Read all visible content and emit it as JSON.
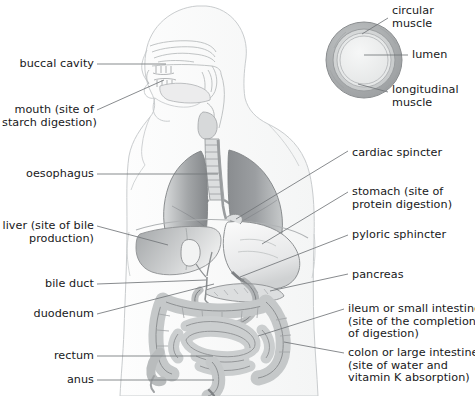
{
  "diagram": {
    "type": "anatomical-diagram",
    "colors": {
      "background": "#ffffff",
      "text": "#17181a",
      "leader_line": "#6e7276",
      "body_outline": "#c9ccce",
      "lung_dark": "#8e9194",
      "lung_light": "#d9dbdc",
      "organ_fill": "#d5d7d8",
      "organ_outline": "#8d9092",
      "liver_fill": "#b9bcbe",
      "inset_outer": "#a9acae",
      "inset_middle": "#cfd1d2",
      "inset_lumen": "#eceded"
    }
  },
  "labels": {
    "left": [
      {
        "id": "buccal-cavity",
        "text": "buccal cavity",
        "x": 18,
        "y": 58,
        "align": "right"
      },
      {
        "id": "mouth",
        "text": "mouth (site of\nstarch digestion)",
        "x": 2,
        "y": 104,
        "align": "right"
      },
      {
        "id": "oesophagus",
        "text": "oesophagus",
        "x": 22,
        "y": 168,
        "align": "right"
      },
      {
        "id": "liver",
        "text": "liver (site of bile\nproduction)",
        "x": 2,
        "y": 220,
        "align": "right"
      },
      {
        "id": "bile-duct",
        "text": "bile duct",
        "x": 35,
        "y": 278,
        "align": "right"
      },
      {
        "id": "duodenum",
        "text": "duodenum",
        "x": 29,
        "y": 308,
        "align": "right"
      },
      {
        "id": "rectum",
        "text": "rectum",
        "x": 44,
        "y": 350,
        "align": "right"
      },
      {
        "id": "anus",
        "text": "anus",
        "x": 57,
        "y": 374,
        "align": "right"
      }
    ],
    "right": [
      {
        "id": "circular-muscle",
        "text": "circular\nmuscle",
        "x": 392,
        "y": 5,
        "align": "left"
      },
      {
        "id": "lumen",
        "text": "lumen",
        "x": 412,
        "y": 49,
        "align": "left"
      },
      {
        "id": "longitudinal-muscle",
        "text": "longitudinal\nmuscle",
        "x": 392,
        "y": 84,
        "align": "left"
      },
      {
        "id": "cardiac-sphincter",
        "text": "cardiac spincter",
        "x": 352,
        "y": 147,
        "align": "left"
      },
      {
        "id": "stomach",
        "text": "stomach (site of\nprotein digestion)",
        "x": 352,
        "y": 186,
        "align": "left"
      },
      {
        "id": "pyloric-sphincter",
        "text": "pyloric sphincter",
        "x": 352,
        "y": 229,
        "align": "left"
      },
      {
        "id": "pancreas",
        "text": "pancreas",
        "x": 352,
        "y": 269,
        "align": "left"
      },
      {
        "id": "ileum",
        "text": "ileum or small intestine\n(site of the completion\nof digestion)",
        "x": 348,
        "y": 303,
        "align": "left"
      },
      {
        "id": "colon",
        "text": "colon or large intestine\n(site of water and\nvitamin K absorption)",
        "x": 348,
        "y": 347,
        "align": "left"
      }
    ]
  }
}
